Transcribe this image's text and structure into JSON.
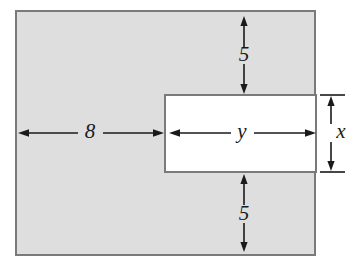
{
  "figure": {
    "type": "geometry-diagram",
    "canvas": {
      "width": 351,
      "height": 271,
      "background": "#ffffff"
    }
  },
  "shapes": {
    "outer_rectangle": {
      "name": "shaded-outer-rectangle",
      "x": 16,
      "y": 11,
      "width": 299,
      "height": 244,
      "fill": "#dedede",
      "stroke": "#7a7a7a",
      "stroke_width": 2
    },
    "inner_rectangle": {
      "name": "white-inner-rectangle",
      "x": 165,
      "y": 95,
      "width": 151,
      "height": 77,
      "fill": "#ffffff",
      "stroke": "#7a7a7a",
      "stroke_width": 2
    }
  },
  "dimensions": [
    {
      "id": "top-margin",
      "label": "5",
      "orientation": "vertical",
      "x": 244,
      "y1": 17,
      "y2": 93,
      "label_x": 244,
      "label_y": 55,
      "italic": false
    },
    {
      "id": "bottom-margin",
      "label": "5",
      "orientation": "vertical",
      "x": 244,
      "y1": 175,
      "y2": 251,
      "label_x": 244,
      "label_y": 214,
      "italic": false
    },
    {
      "id": "left-margin",
      "label": "8",
      "orientation": "horizontal",
      "y": 133,
      "x1": 19,
      "x2": 163,
      "label_x": 90,
      "label_y": 132,
      "italic": false
    },
    {
      "id": "inner-width",
      "label": "y",
      "orientation": "horizontal",
      "y": 133,
      "x1": 170,
      "x2": 315,
      "label_x": 242,
      "label_y": 132,
      "italic": true
    },
    {
      "id": "inner-height",
      "label": "x",
      "orientation": "vertical",
      "x": 330,
      "y1": 96,
      "y2": 171,
      "label_x": 340,
      "label_y": 133,
      "italic": true,
      "extension_lines": [
        {
          "x1": 320,
          "x2": 345,
          "y": 95
        },
        {
          "x1": 320,
          "x2": 345,
          "y": 172
        }
      ]
    }
  ],
  "style": {
    "line_color": "#1a1a1a",
    "line_width": 1.6,
    "arrow_length": 9,
    "arrow_half_width": 3.6,
    "label_font_size": 21
  }
}
